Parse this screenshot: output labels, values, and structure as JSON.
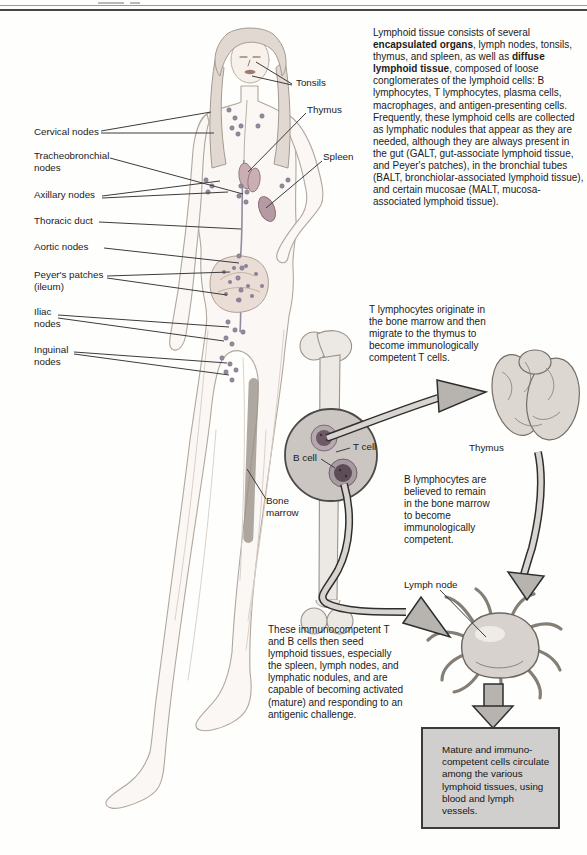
{
  "intro": {
    "s1": "Lymphoid tissue consists of several ",
    "s2": "encapsulated organs",
    "s3": ", lymph nodes, tonsils, thymus, and spleen, as well as ",
    "s4": "diffuse lymphoid tissue",
    "s5": ", composed of loose conglomerates of the lymphoid cells: B lymphocytes, T lymphocytes, plasma cells, macrophages, and antigen-presenting cells. Frequently, these lymphoid cells are collected as lymphatic nodules that appear as they are needed, although they are always present in the gut (GALT, gut-associate lymphoid tissue, and Peyer's patches), in the bronchial tubes (BALT, bronchiolar-associated lymphoid tissue), and certain mucosae (MALT, mucosa-associated lymphoid tissue)."
  },
  "labels": {
    "tonsils": "Tonsils",
    "thymus_body": "Thymus",
    "spleen": "Spleen",
    "cervical": "Cervical nodes",
    "tracheobronchial": "Tracheobronchial nodes",
    "axillary": "Axillary nodes",
    "thoracic": "Thoracic duct",
    "aortic": "Aortic nodes",
    "peyers": "Peyer's patches (ileum)",
    "iliac": "Iliac nodes",
    "inguinal": "Inguinal nodes",
    "bone_marrow": "Bone marrow",
    "t_cell": "T cell",
    "b_cell": "B cell",
    "thymus_diagram": "Thymus",
    "lymph_node": "Lymph node"
  },
  "flow_text": {
    "t_origin": "T lymphocytes originate in the bone marrow and then migrate to the thymus to become immunologically competent T cells.",
    "b_origin": "B lymphocytes are believed to remain in the bone marrow to become immunologically competent.",
    "seeding": "These immunocompetent T and B cells then seed lymphoid tissues, especially the spleen, lymph nodes, and lymphatic nodules, and are capable of becoming activated (mature) and responding to an antigenic challenge.",
    "circulation": "Mature and immuno-competent cells circulate among the various lymphoid tissues, using blood and lymph vessels."
  },
  "colors": {
    "box_background": "#d0cfce",
    "box_border": "#3b3b3b",
    "arrow_fill": "#b7b3ae",
    "arrow_outline": "#2e2e2e",
    "illustration_gray": "#d8d3ce",
    "node_dot": "#968aa0",
    "cell_core": "#6e5a65"
  }
}
